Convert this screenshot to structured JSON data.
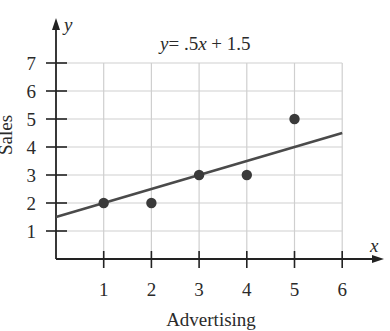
{
  "chart_data": {
    "type": "scatter",
    "title_parts": {
      "y": "y",
      "eq": "= .5",
      "x": "x",
      "rest": " + 1.5"
    },
    "xlabel": "Advertising",
    "ylabel": "Sales",
    "x_axis_symbol": "x",
    "y_axis_symbol": "y",
    "xlim": [
      0,
      6
    ],
    "ylim": [
      0,
      7
    ],
    "x_ticks": [
      1,
      2,
      3,
      4,
      5,
      6
    ],
    "y_ticks": [
      1,
      2,
      3,
      4,
      5,
      6,
      7
    ],
    "grid": true,
    "points": [
      {
        "x": 1,
        "y": 2
      },
      {
        "x": 2,
        "y": 2
      },
      {
        "x": 3,
        "y": 3
      },
      {
        "x": 4,
        "y": 3
      },
      {
        "x": 5,
        "y": 5
      }
    ],
    "regression_line": {
      "slope": 0.5,
      "intercept": 1.5,
      "x_range": [
        0,
        6
      ]
    },
    "colors": {
      "point": "#3a3a3a",
      "line": "#4a4a4a",
      "grid": "#cfcfcf",
      "axis": "#222222"
    }
  }
}
